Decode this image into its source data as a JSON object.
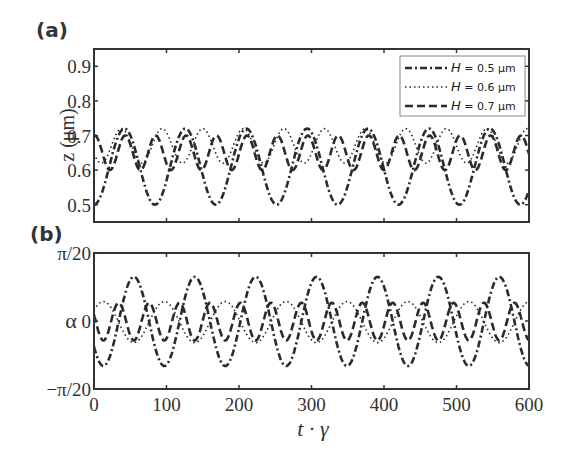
{
  "chart_data": [
    {
      "panel": "(a)",
      "type": "line",
      "title": "",
      "xlabel": "",
      "ylabel": "z (μm)",
      "xlim": [
        0,
        600
      ],
      "ylim": [
        0.45,
        0.95
      ],
      "yticks": [
        0.5,
        0.6,
        0.7,
        0.8,
        0.9
      ],
      "ytick_labels": [
        "0.5",
        "0.6",
        "0.7",
        "0.8",
        "0.9"
      ],
      "xticks": [
        0,
        100,
        200,
        300,
        400,
        500,
        600
      ],
      "grid": false,
      "legend_position": "upper right",
      "series": [
        {
          "name": "H = 0.5 μm",
          "style": "dash-dot",
          "model": "oscillation",
          "min": 0.5,
          "max": 0.72,
          "period": 84,
          "phase_min_at": 0
        },
        {
          "name": "H = 0.6 μm",
          "style": "dotted",
          "model": "oscillation",
          "min": 0.62,
          "max": 0.72,
          "period": 56,
          "phase_min_at": 10
        },
        {
          "name": "H = 0.7 μm",
          "style": "dashed",
          "model": "oscillation",
          "min": 0.6,
          "max": 0.7,
          "period": 42,
          "phase_min_at": 22
        }
      ]
    },
    {
      "panel": "(b)",
      "type": "line",
      "title": "",
      "xlabel": "t · γ",
      "ylabel": "α",
      "xlim": [
        0,
        600
      ],
      "ylim": [
        -0.15708,
        0.15708
      ],
      "yticks": [
        -0.15708,
        0,
        0.15708
      ],
      "ytick_labels": [
        "−π/20",
        "0",
        "π/20"
      ],
      "xticks": [
        0,
        100,
        200,
        300,
        400,
        500,
        600
      ],
      "xtick_labels": [
        "0",
        "100",
        "200",
        "300",
        "400",
        "500",
        "600"
      ],
      "grid": false,
      "series": [
        {
          "name": "H = 0.5 μm",
          "style": "dash-dot",
          "model": "oscillation",
          "min": -0.104,
          "max": 0.102,
          "period": 84,
          "phase_min_at": 13
        },
        {
          "name": "H = 0.6 μm",
          "style": "dotted",
          "model": "oscillation",
          "min": -0.05,
          "max": 0.045,
          "period": 84,
          "phase_min_at": 55
        },
        {
          "name": "H = 0.7 μm",
          "style": "dashed",
          "model": "oscillation",
          "min": -0.045,
          "max": 0.042,
          "period": 42,
          "phase_min_at": 55
        }
      ]
    }
  ],
  "labels": {
    "panel_a": "(a)",
    "panel_b": "(b)",
    "ylabel_a": "z (μm)",
    "ylabel_b": "α",
    "xlabel": "t · γ"
  },
  "legend": [
    {
      "label_italic": "H",
      "label_rest": " = 0.5  μm",
      "style": "dash-dot"
    },
    {
      "label_italic": "H",
      "label_rest": " = 0.6  μm",
      "style": "dotted"
    },
    {
      "label_italic": "H",
      "label_rest": " = 0.7  μm",
      "style": "dashed"
    }
  ]
}
